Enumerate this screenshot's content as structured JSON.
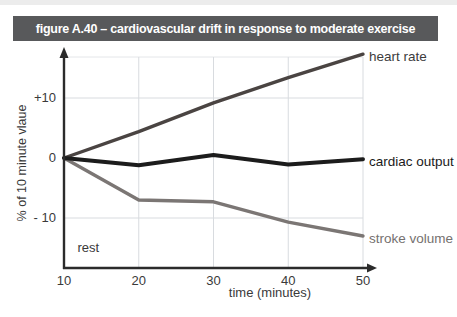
{
  "page": {
    "bg": "#ffffff",
    "top_edge_color": "#dcdcdc"
  },
  "figure_header": {
    "title": "figure A.40 – cardiovascular drift in response to moderate exercise",
    "bg": "#58595b",
    "text_color": "#ffffff"
  },
  "chart_data": {
    "type": "line",
    "title": "figure A.40 – cardiovascular drift in response to moderate exercise",
    "xlabel": "time (minutes)",
    "ylabel": "% of 10 minute vlaue",
    "x_ticks": [
      10,
      20,
      30,
      40,
      50
    ],
    "y_ticks": [
      {
        "label": "+10",
        "value": 10
      },
      {
        "label": "0",
        "value": 0
      },
      {
        "label": "- 10",
        "value": -10
      }
    ],
    "xlim": [
      10,
      50
    ],
    "ylim": [
      -18,
      17.5
    ],
    "grid": true,
    "axis_color": "#2b2b2b",
    "grid_color": "#d8dbdf",
    "annotations": [
      {
        "text": "rest",
        "x": 11.8,
        "y": -15
      }
    ],
    "series": [
      {
        "name": "heart rate",
        "color": "#4a4442",
        "label_color": "#3c3c3c",
        "width": 3.4,
        "x": [
          10,
          20,
          30,
          40,
          50
        ],
        "values": [
          0,
          4.4,
          9.2,
          13.4,
          17.3
        ]
      },
      {
        "name": "cardiac output",
        "color": "#1c1c1c",
        "label_color": "#1a1a1a",
        "width": 4,
        "x": [
          10,
          20,
          30,
          40,
          50
        ],
        "values": [
          0,
          -1.2,
          0.5,
          -1.1,
          -0.2
        ]
      },
      {
        "name": "stroke volume",
        "color": "#7b7674",
        "label_color": "#75716f",
        "width": 3.4,
        "x": [
          10,
          20,
          30,
          40,
          50
        ],
        "values": [
          0,
          -7,
          -7.3,
          -10.7,
          -13
        ]
      }
    ]
  }
}
